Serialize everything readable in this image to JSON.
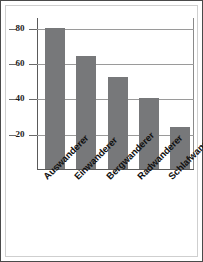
{
  "chart_data": {
    "type": "bar",
    "title": "",
    "subtitle": "",
    "xlabel": "",
    "ylabel": "",
    "categories": [
      "Auswanderer",
      "Einwanderer",
      "Bergwanderer",
      "Radwanderer",
      "Schlafwanderer"
    ],
    "values": [
      80,
      64,
      52,
      40,
      24
    ],
    "series": [
      {
        "name": "",
        "values": [
          80,
          64,
          52,
          40,
          24
        ]
      }
    ],
    "ylim": [
      0,
      86
    ],
    "yticks": [
      20,
      40,
      60,
      80
    ],
    "ytick_labels": [
      "20",
      "40",
      "60",
      "80"
    ],
    "grid": true,
    "legend": false,
    "legend_position": "none",
    "annotations": [],
    "bar_color": "#77787a",
    "gridline_color": "#9a9a9a",
    "axis_color": "#5a5a5a",
    "frame_color": "#4a4a4a",
    "background_color": "#ffffff",
    "label_rotation_degrees": -45
  }
}
